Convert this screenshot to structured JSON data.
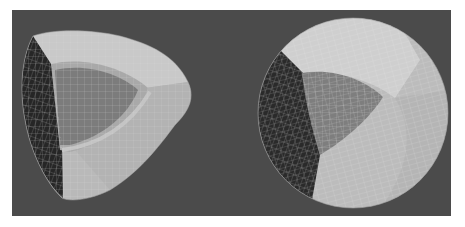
{
  "figure": {
    "background_color": "#ffffff",
    "panel": {
      "x": 12,
      "y": 10,
      "width": 439,
      "height": 206,
      "color": "#4b4b4b"
    },
    "meshes": [
      {
        "name": "rounded-tetrahedral-mesh",
        "faces": {
          "dark_side": "#262626",
          "light_band": "#b9b9b9",
          "top_band": "#c8c8c8",
          "inner_face": "#7c7c7c",
          "inner_rim": "#a8a8a8"
        },
        "wire_color": "#d8d8d8"
      },
      {
        "name": "spherical-mesh",
        "center": [
          353,
          113
        ],
        "radius": 95,
        "faces": {
          "dark_sector": "#2a2a2a",
          "top_sector": "#cfcfcf",
          "right_sector": "#bcbcbc",
          "inner_face": "#7e7e7e"
        },
        "wire_color": "#dcdcdc"
      }
    ]
  }
}
